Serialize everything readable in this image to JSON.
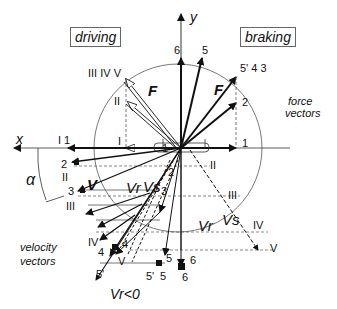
{
  "titles": {
    "left": "driving",
    "right": "braking"
  },
  "axes": {
    "x": "x",
    "y": "y",
    "angle": "α"
  },
  "force": {
    "caption_line1": "force",
    "caption_line2": "vectors",
    "symbol": "F",
    "labels_right": {
      "top1": "6",
      "top2": "5",
      "group": "5' 4 3",
      "two": "2",
      "one": "1"
    },
    "labels_left": {
      "group": "III IV V",
      "two": "II",
      "one": "I",
      "axis_one": "I 1"
    }
  },
  "velocity": {
    "caption_line1": "velocity",
    "caption_line2": "vectors",
    "symbol_V": "V",
    "symbol_Vr": "Vr",
    "symbol_Vs": "Vs",
    "sub_r": "r",
    "sub_s": "s",
    "negative_note": "Vr<0",
    "labels": [
      "2",
      "II",
      "3",
      "III",
      "IV",
      "4",
      "4",
      "5'",
      "V",
      "5'",
      "5",
      "5",
      "6",
      "6",
      "1",
      "2",
      "3",
      "II",
      "III",
      "IV",
      "V"
    ]
  }
}
